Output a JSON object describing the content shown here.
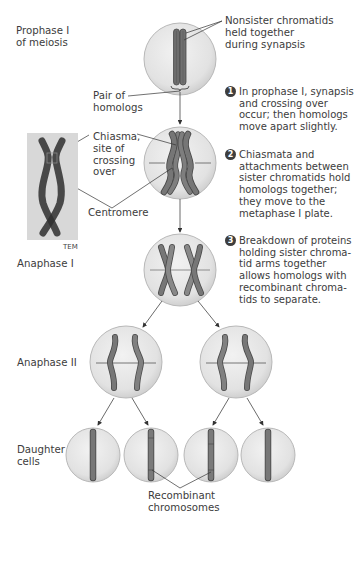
{
  "stages": {
    "prophase": "Prophase I\nof meiosis",
    "prophase_line1": "Prophase I",
    "prophase_line2": "of meiosis",
    "anaphase1": "Anaphase I",
    "anaphase2": "Anaphase II",
    "daughter_line1": "Daughter",
    "daughter_line2": "cells"
  },
  "callouts": {
    "nonsister": [
      "Nonsister chromatids",
      "held together",
      "during synapsis"
    ],
    "pair": [
      "Pair of",
      "homologs"
    ],
    "chiasma": [
      "Chiasma,",
      "site of",
      "crossing",
      "over"
    ],
    "centromere": "Centromere",
    "tem": "TEM",
    "recombinant": [
      "Recombinant",
      "chromosomes"
    ]
  },
  "steps": [
    {
      "num": "1",
      "lines": [
        "In prophase I, synapsis",
        "and crossing over",
        "occur; then homologs",
        "move apart slightly."
      ]
    },
    {
      "num": "2",
      "lines": [
        "Chiasmata and",
        "attachments between",
        "sister chromatids hold",
        "homologs together;",
        "they move to the",
        "metaphase I plate."
      ]
    },
    {
      "num": "3",
      "lines": [
        "Breakdown of proteins",
        "holding sister chroma-",
        "tid arms together",
        "allows homologs with",
        "recombinant chroma-",
        "tids to separate."
      ]
    }
  ],
  "colors": {
    "cell_fill": "#e6e6e6",
    "cell_stroke": "#b5b5b5",
    "chromosome": "#6e6e6e",
    "chromosome_dark": "#4a4a4a",
    "line": "#3a3a3a"
  }
}
